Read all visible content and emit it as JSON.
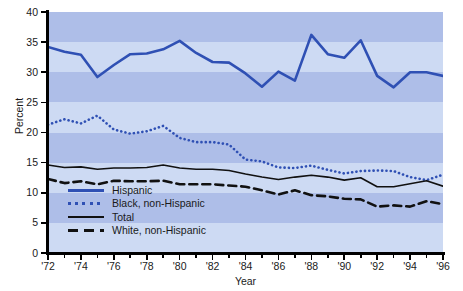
{
  "chart_data": {
    "type": "line",
    "title": "",
    "xlabel": "Year",
    "ylabel": "Percent",
    "xlim": [
      1972,
      1996
    ],
    "ylim": [
      0,
      40
    ],
    "grid": "horizontal-bands-every-5",
    "legend_position": "inside-lower-left",
    "x": [
      1972,
      1973,
      1974,
      1975,
      1976,
      1977,
      1978,
      1979,
      1980,
      1981,
      1982,
      1983,
      1984,
      1985,
      1986,
      1987,
      1988,
      1989,
      1990,
      1991,
      1992,
      1993,
      1994,
      1995,
      1996
    ],
    "x_tick_labels": [
      "'72",
      "'74",
      "'76",
      "'78",
      "'80",
      "'82",
      "'84",
      "'86",
      "'88",
      "'90",
      "'92",
      "'94",
      "'96"
    ],
    "x_tick_values": [
      1972,
      1974,
      1976,
      1978,
      1980,
      1982,
      1984,
      1986,
      1988,
      1990,
      1992,
      1994,
      1996
    ],
    "y_tick_labels": [
      "0",
      "5",
      "10",
      "15",
      "20",
      "25",
      "30",
      "35",
      "40"
    ],
    "y_tick_values": [
      0,
      5,
      10,
      15,
      20,
      25,
      30,
      35,
      40
    ],
    "series": [
      {
        "name": "Hispanic",
        "style": "solid",
        "color": "#2f50b4",
        "width": 2.6,
        "values": [
          34.2,
          33.4,
          32.9,
          29.2,
          31.2,
          33.0,
          33.1,
          33.8,
          35.2,
          33.2,
          31.7,
          31.6,
          29.8,
          27.6,
          30.1,
          28.6,
          36.2,
          33.0,
          32.4,
          35.3,
          29.4,
          27.5,
          30.0,
          30.0,
          29.4
        ]
      },
      {
        "name": "Black, non-Hispanic",
        "style": "dotted",
        "color": "#2f50b4",
        "width": 2.6,
        "values": [
          21.3,
          22.2,
          21.5,
          22.8,
          20.5,
          19.8,
          20.2,
          21.1,
          19.1,
          18.4,
          18.4,
          18.0,
          15.5,
          15.2,
          14.2,
          14.1,
          14.5,
          13.8,
          13.2,
          13.6,
          13.7,
          13.6,
          12.6,
          12.1,
          13.0
        ]
      },
      {
        "name": "Total",
        "style": "solid",
        "color": "#111111",
        "width": 1.6,
        "values": [
          14.6,
          14.2,
          14.3,
          13.9,
          14.1,
          14.1,
          14.2,
          14.6,
          14.1,
          13.9,
          13.9,
          13.7,
          13.1,
          12.6,
          12.2,
          12.6,
          12.9,
          12.6,
          12.1,
          12.5,
          11.0,
          11.0,
          11.5,
          12.0,
          11.1
        ]
      },
      {
        "name": "White, non-Hispanic",
        "style": "dashed",
        "color": "#111111",
        "width": 2.6,
        "values": [
          12.3,
          11.6,
          11.9,
          11.4,
          12.0,
          11.9,
          11.9,
          12.0,
          11.4,
          11.4,
          11.4,
          11.2,
          11.0,
          10.4,
          9.7,
          10.4,
          9.6,
          9.4,
          9.0,
          8.9,
          7.7,
          7.9,
          7.7,
          8.6,
          8.1
        ]
      }
    ]
  },
  "legend": {
    "items": [
      {
        "label": "Hispanic"
      },
      {
        "label": "Black, non-Hispanic"
      },
      {
        "label": "Total"
      },
      {
        "label": "White, non-Hispanic"
      }
    ]
  },
  "colors": {
    "band_dark": "#aebee8",
    "band_light": "#cddaf3",
    "accent_blue": "#2f50b4",
    "ink": "#111111"
  }
}
